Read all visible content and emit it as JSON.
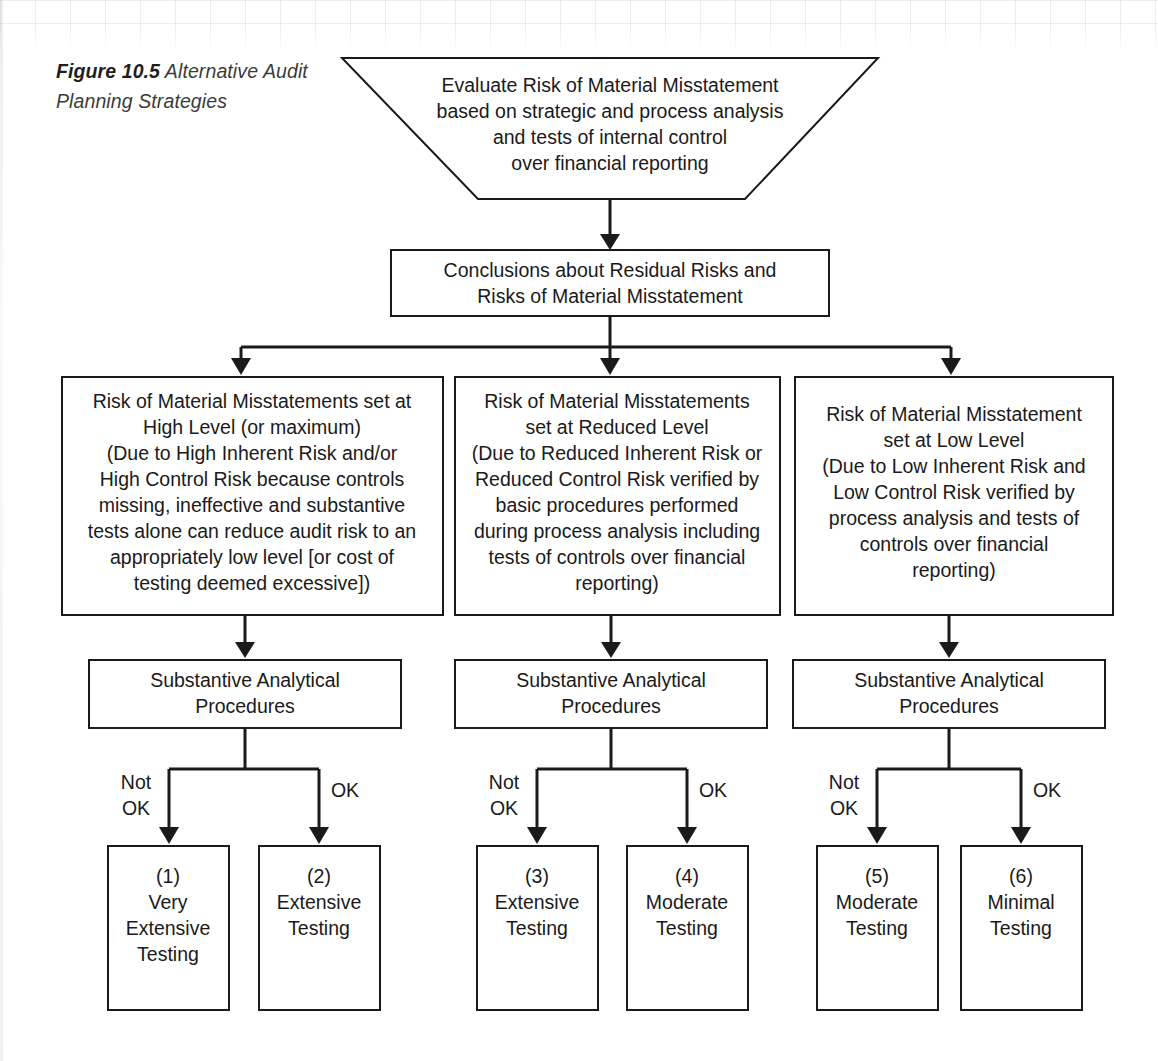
{
  "figure": {
    "number": "Figure 10.5",
    "title": "Alternative Audit Planning Strategies"
  },
  "colors": {
    "stroke": "#1a1a1a",
    "fill": "#ffffff",
    "caption_text": "#3b3b3b",
    "page_background": "#ffffff"
  },
  "nodes": {
    "evaluate": {
      "shape": "inverted-trapezoid",
      "lines": [
        "Evaluate Risk of Material Misstatement",
        "based on strategic and process analysis",
        "and tests of internal control",
        "over financial reporting"
      ]
    },
    "conclusions": {
      "shape": "rectangle",
      "lines": [
        "Conclusions about Residual Risks and",
        "Risks of Material Misstatement"
      ]
    },
    "risk_high": {
      "shape": "rectangle",
      "lines": [
        "Risk of Material Misstatements set at",
        "High Level (or maximum)",
        "(Due to High Inherent Risk and/or",
        "High Control Risk because controls",
        "missing, ineffective and substantive",
        "tests alone can reduce audit risk to an",
        "appropriately low level [or cost of",
        "testing deemed excessive])"
      ]
    },
    "risk_reduced": {
      "shape": "rectangle",
      "lines": [
        "Risk of Material Misstatements",
        "set at Reduced Level",
        "(Due to Reduced Inherent Risk or",
        "Reduced Control Risk verified by",
        "basic procedures performed",
        "during process analysis including",
        "tests of controls over financial",
        "reporting)"
      ]
    },
    "risk_low": {
      "shape": "rectangle",
      "lines": [
        "Risk of Material Misstatement",
        "set at Low Level",
        "(Due to Low Inherent Risk and",
        "Low Control Risk verified by",
        "process analysis and tests of",
        "controls over financial",
        "reporting)"
      ]
    },
    "sap_left": {
      "shape": "rectangle",
      "lines": [
        "Substantive Analytical",
        "Procedures"
      ]
    },
    "sap_middle": {
      "shape": "rectangle",
      "lines": [
        "Substantive Analytical",
        "Procedures"
      ]
    },
    "sap_right": {
      "shape": "rectangle",
      "lines": [
        "Substantive Analytical",
        "Procedures"
      ]
    },
    "outcome_1": {
      "shape": "rectangle",
      "lines": [
        "(1)",
        "Very",
        "Extensive",
        "Testing"
      ]
    },
    "outcome_2": {
      "shape": "rectangle",
      "lines": [
        "(2)",
        "Extensive",
        "Testing"
      ]
    },
    "outcome_3": {
      "shape": "rectangle",
      "lines": [
        "(3)",
        "Extensive",
        "Testing"
      ]
    },
    "outcome_4": {
      "shape": "rectangle",
      "lines": [
        "(4)",
        "Moderate",
        "Testing"
      ]
    },
    "outcome_5": {
      "shape": "rectangle",
      "lines": [
        "(5)",
        "Moderate",
        "Testing"
      ]
    },
    "outcome_6": {
      "shape": "rectangle",
      "lines": [
        "(6)",
        "Minimal",
        "Testing"
      ]
    }
  },
  "branch_labels": {
    "left_group": {
      "not_ok": [
        "Not",
        "OK"
      ],
      "ok": "OK"
    },
    "middle_group": {
      "not_ok": [
        "Not",
        "OK"
      ],
      "ok": "OK"
    },
    "right_group": {
      "not_ok": [
        "Not",
        "OK"
      ],
      "ok": "OK"
    }
  },
  "text_lines": {
    "evaluate_0": "Evaluate Risk of Material Misstatement",
    "evaluate_1": "based on strategic and process analysis",
    "evaluate_2": "and tests of internal control",
    "evaluate_3": "over financial reporting",
    "conclusions_0": "Conclusions about Residual Risks and",
    "conclusions_1": "Risks of Material Misstatement",
    "high_0": "Risk of Material Misstatements set at",
    "high_1": "High Level (or maximum)",
    "high_2": "(Due to High Inherent Risk and/or",
    "high_3": "High Control Risk because controls",
    "high_4": "missing, ineffective and substantive",
    "high_5": "tests alone can reduce audit risk to an",
    "high_6": "appropriately low level [or cost of",
    "high_7": "testing deemed excessive])",
    "reduced_0": "Risk of Material Misstatements",
    "reduced_1": "set at Reduced Level",
    "reduced_2": "(Due to Reduced Inherent Risk or",
    "reduced_3": "Reduced Control Risk verified by",
    "reduced_4": "basic procedures performed",
    "reduced_5": "during process analysis including",
    "reduced_6": "tests of controls over financial",
    "reduced_7": "reporting)",
    "low_0": "Risk of Material Misstatement",
    "low_1": "set at Low Level",
    "low_2": "(Due to Low Inherent Risk and",
    "low_3": "Low Control Risk verified by",
    "low_4": "process analysis and tests of",
    "low_5": "controls over financial",
    "low_6": "reporting)",
    "sapL_0": "Substantive Analytical",
    "sapL_1": "Procedures",
    "sapM_0": "Substantive Analytical",
    "sapM_1": "Procedures",
    "sapR_0": "Substantive Analytical",
    "sapR_1": "Procedures",
    "o1_0": "(1)",
    "o1_1": "Very",
    "o1_2": "Extensive",
    "o1_3": "Testing",
    "o2_0": "(2)",
    "o2_1": "Extensive",
    "o2_2": "Testing",
    "o3_0": "(3)",
    "o3_1": "Extensive",
    "o3_2": "Testing",
    "o4_0": "(4)",
    "o4_1": "Moderate",
    "o4_2": "Testing",
    "o5_0": "(5)",
    "o5_1": "Moderate",
    "o5_2": "Testing",
    "o6_0": "(6)",
    "o6_1": "Minimal",
    "o6_2": "Testing",
    "notL_0": "Not",
    "notL_1": "OK",
    "okL": "OK",
    "notM_0": "Not",
    "notM_1": "OK",
    "okM": "OK",
    "notR_0": "Not",
    "notR_1": "OK",
    "okR": "OK"
  }
}
